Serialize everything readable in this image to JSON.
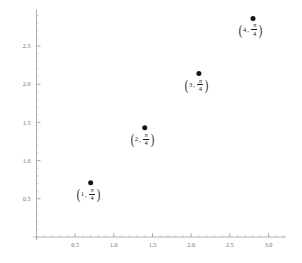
{
  "figure": {
    "title": "",
    "background_color": "#ffffff",
    "axis_color": "#9a9a9a",
    "point_color": "#141414",
    "label_color": "#1a1a1a"
  },
  "chart_data": {
    "type": "scatter",
    "title": "",
    "xlabel": "",
    "ylabel": "",
    "xlim": [
      0,
      3.2
    ],
    "ylim": [
      0,
      2.95
    ],
    "grid": false,
    "legend": null,
    "xticks": [
      0.5,
      1.0,
      1.5,
      2.0,
      2.5,
      3.0
    ],
    "xtick_labels": [
      "0.5",
      "1.0",
      "1.5",
      "2.0",
      "2.5",
      "3.0"
    ],
    "yticks": [
      0.5,
      1.0,
      1.5,
      2.0,
      2.5
    ],
    "ytick_labels": [
      "0.5",
      "1.0",
      "1.5",
      "2.0",
      "2.5"
    ],
    "x_minor_step": 0.1,
    "y_minor_step": 0.1,
    "x": [
      0.7,
      1.4,
      2.1,
      2.8
    ],
    "y": [
      0.7854,
      1.5708,
      2.3562,
      3.1416
    ],
    "y_plotted": [
      0.71,
      1.43,
      2.14,
      2.86
    ],
    "point_size": 5,
    "points": [
      {
        "index": "1",
        "x": 0.7,
        "y": 0.71,
        "label_index": "1",
        "label_comma": ",",
        "label_numerator": "π",
        "label_denominator": "4",
        "label_open": "(",
        "label_close": ")",
        "label_text": "(1, π/4)"
      },
      {
        "index": "2",
        "x": 1.4,
        "y": 1.43,
        "label_index": "2",
        "label_comma": ",",
        "label_numerator": "π",
        "label_denominator": "4",
        "label_open": "(",
        "label_close": ")",
        "label_text": "(2, π/4)"
      },
      {
        "index": "3",
        "x": 2.1,
        "y": 2.14,
        "label_index": "3",
        "label_comma": ",",
        "label_numerator": "π",
        "label_denominator": "4",
        "label_open": "(",
        "label_close": ")",
        "label_text": "(3, π/4)"
      },
      {
        "index": "4",
        "x": 2.8,
        "y": 2.86,
        "label_index": "4",
        "label_comma": ",",
        "label_numerator": "π",
        "label_denominator": "4",
        "label_open": "(",
        "label_close": ")",
        "label_text": "(4, π/4)"
      }
    ]
  }
}
